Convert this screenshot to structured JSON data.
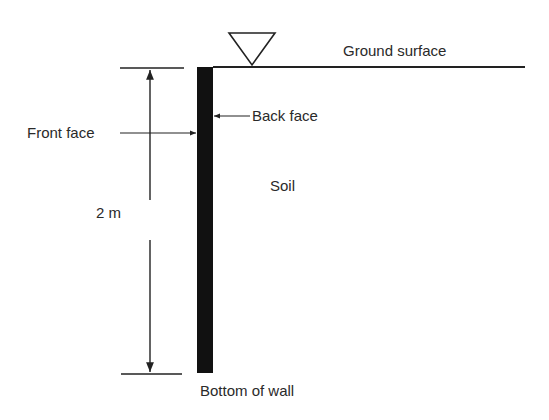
{
  "diagram": {
    "labels": {
      "ground_surface": "Ground surface",
      "back_face": "Back face",
      "front_face": "Front face",
      "soil": "Soil",
      "height": "2 m",
      "bottom_of_wall": "Bottom of wall"
    },
    "icons": {
      "water_table_marker": "inverted-triangle"
    },
    "colors": {
      "wall": "#111111",
      "lines": "#222222"
    }
  }
}
